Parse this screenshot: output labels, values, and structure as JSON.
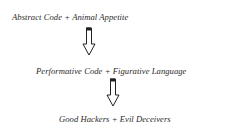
{
  "diagram": {
    "nodes": [
      {
        "id": "n1",
        "text": "Abstract Code + Animal Appetite"
      },
      {
        "id": "n2",
        "text": "Performative Code + Figurative Language"
      },
      {
        "id": "n3",
        "text": "Good Hackers + Evil Deceivers"
      }
    ],
    "edges": [
      {
        "from": "n1",
        "to": "n2",
        "icon": "down-arrow-icon"
      },
      {
        "from": "n2",
        "to": "n3",
        "icon": "down-arrow-icon"
      }
    ]
  }
}
